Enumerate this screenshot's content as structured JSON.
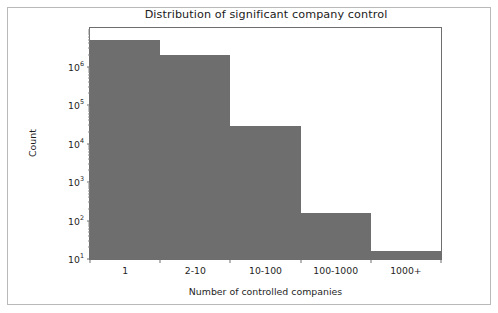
{
  "chart_data": {
    "type": "bar",
    "title": "Distribution of significant company control",
    "xlabel": "Number of controlled companies",
    "ylabel": "Count",
    "categories": [
      "1",
      "2-10",
      "10-100",
      "100-1000",
      "1000+"
    ],
    "values": [
      5000000,
      2000000,
      28000,
      160,
      16
    ],
    "yscale": "log",
    "ylim": [
      10,
      10000000
    ],
    "xlim": [
      0,
      5
    ],
    "grid": false,
    "legend": null,
    "bar_color": "#6e6e6e",
    "ytick_labels": [
      {
        "mantissa": "10",
        "exponent": "1",
        "value": 10
      },
      {
        "mantissa": "10",
        "exponent": "2",
        "value": 100
      },
      {
        "mantissa": "10",
        "exponent": "3",
        "value": 1000
      },
      {
        "mantissa": "10",
        "exponent": "4",
        "value": 10000
      },
      {
        "mantissa": "10",
        "exponent": "5",
        "value": 100000
      },
      {
        "mantissa": "10",
        "exponent": "6",
        "value": 1000000
      }
    ]
  },
  "figure": {
    "background": "#ffffff",
    "frame_color": "#b9b9b9",
    "axes_color": "#6e6e6e"
  }
}
